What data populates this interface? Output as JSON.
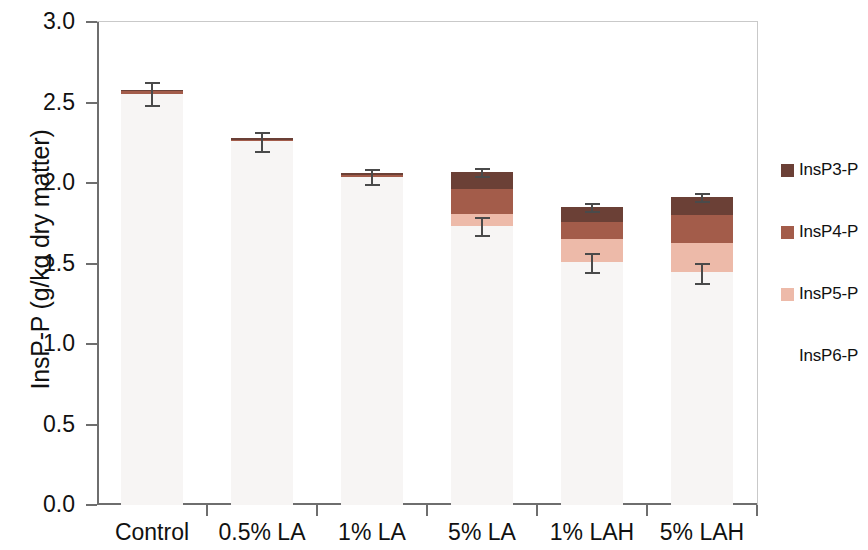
{
  "chart_data": {
    "type": "bar",
    "stacked": true,
    "title": "",
    "xlabel": "",
    "ylabel": "InsP-P (g/kg dry matter)",
    "ylim": [
      0.0,
      3.0
    ],
    "ytick_values": [
      0.0,
      0.5,
      1.0,
      1.5,
      2.0,
      2.5,
      3.0
    ],
    "ytick_labels": [
      "0.0",
      "0.5",
      "1.0",
      "1.5",
      "2.0",
      "2.5",
      "3.0"
    ],
    "grid": false,
    "legend_position": "right",
    "categories": [
      "Control",
      "0.5% LA",
      "1% LA",
      "5% LA",
      "1% LAH",
      "5% LAH"
    ],
    "series": [
      {
        "name": "InsP6-P",
        "color": "#f7f5f4",
        "values": [
          2.55,
          2.26,
          2.04,
          1.73,
          1.51,
          1.45
        ]
      },
      {
        "name": "InsP5-P",
        "color": "#edbaa9",
        "values": [
          0.0,
          0.0,
          0.0,
          0.08,
          0.14,
          0.18
        ]
      },
      {
        "name": "InsP4-P",
        "color": "#a35c4a",
        "values": [
          0.02,
          0.01,
          0.01,
          0.15,
          0.11,
          0.17
        ]
      },
      {
        "name": "InsP3-P",
        "color": "#6b4036",
        "values": [
          0.01,
          0.01,
          0.01,
          0.11,
          0.09,
          0.11
        ]
      }
    ],
    "totals": [
      2.58,
      2.28,
      2.06,
      2.07,
      1.85,
      1.91
    ],
    "error_bars": [
      {
        "category": "Control",
        "value": 2.58,
        "err_low": 0.1,
        "err_high": 0.04
      },
      {
        "category": "0.5% LA",
        "value": 2.28,
        "err_low": 0.09,
        "err_high": 0.03
      },
      {
        "category": "1% LA",
        "value": 2.06,
        "err_low": 0.07,
        "err_high": 0.02
      },
      {
        "category": "5% LA",
        "value": 2.07,
        "err_low": 0.03,
        "err_high": 0.02
      },
      {
        "category": "5% LA inner",
        "value": 1.73,
        "err_low": 0.06,
        "err_high": 0.05
      },
      {
        "category": "1% LAH",
        "value": 1.85,
        "err_low": 0.03,
        "err_high": 0.02
      },
      {
        "category": "1% LAH inner",
        "value": 1.51,
        "err_low": 0.07,
        "err_high": 0.05
      },
      {
        "category": "5% LAH",
        "value": 1.91,
        "err_low": 0.03,
        "err_high": 0.02
      },
      {
        "category": "5% LAH inner",
        "value": 1.45,
        "err_low": 0.08,
        "err_high": 0.05
      }
    ]
  },
  "axes": {
    "y_title": "InsP-P (g/kg dry matter)",
    "y_ticks": [
      "3.0",
      "2.5",
      "2.0",
      "1.5",
      "1.0",
      "0.5",
      "0.0"
    ],
    "x_ticks": [
      "Control",
      "0.5% LA",
      "1% LA",
      "5% LA",
      "1% LAH",
      "5% LAH"
    ]
  },
  "legend": {
    "items": [
      {
        "label": "InsP3-P",
        "color": "#6b4036",
        "swatch": true
      },
      {
        "label": "InsP4-P",
        "color": "#a35c4a",
        "swatch": true
      },
      {
        "label": "InsP5-P",
        "color": "#edbaa9",
        "swatch": true
      },
      {
        "label": "InsP6-P",
        "color": "#f7f5f4",
        "swatch": false
      }
    ]
  },
  "colors": {
    "axis": "#6e6e6e",
    "error_bar": "#4a4a4a",
    "background": "#ffffff",
    "text": "#111111"
  }
}
